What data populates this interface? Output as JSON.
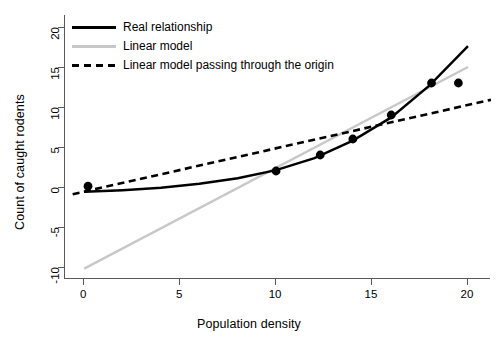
{
  "chart_data": {
    "type": "scatter",
    "title": "",
    "xlabel": "Population density",
    "ylabel": "Count of caught rodents",
    "xlim": [
      -1.0,
      21.2
    ],
    "ylim": [
      -11.5,
      21.5
    ],
    "xticks": [
      0,
      5,
      10,
      15,
      20
    ],
    "xtick_labels": [
      "0",
      "5",
      "10",
      "15",
      "20"
    ],
    "yticks": [
      -10,
      -5,
      0,
      5,
      10,
      15,
      20
    ],
    "ytick_labels": [
      "-10",
      "-5",
      "0",
      "5",
      "10",
      "15",
      "20"
    ],
    "grid": false,
    "legend_position": "top-left",
    "points": [
      {
        "x": 0.2,
        "y": 0.1
      },
      {
        "x": 10.0,
        "y": 2.0
      },
      {
        "x": 12.3,
        "y": 4.0
      },
      {
        "x": 14.0,
        "y": 6.0
      },
      {
        "x": 16.0,
        "y": 9.0
      },
      {
        "x": 18.1,
        "y": 13.0
      },
      {
        "x": 19.5,
        "y": 13.0
      }
    ],
    "series": [
      {
        "name": "Real relationship",
        "type": "curve",
        "color": "#000000",
        "style": "solid",
        "width": 2.4,
        "x": [
          0,
          2,
          4,
          6,
          8,
          10,
          12,
          14,
          16,
          18,
          20
        ],
        "y": [
          -0.6,
          -0.4,
          -0.1,
          0.4,
          1.1,
          2.1,
          3.6,
          5.8,
          8.7,
          12.7,
          17.6
        ]
      },
      {
        "name": "Linear model",
        "type": "line",
        "color": "#c8c8c8",
        "style": "solid",
        "width": 2.4,
        "intercept": -10.2,
        "slope": 1.26,
        "x": [
          0,
          20
        ],
        "y": [
          -10.2,
          15.0
        ]
      },
      {
        "name": "Linear model passing through the origin",
        "type": "line",
        "color": "#000000",
        "style": "dashed",
        "width": 2.6,
        "intercept": -0.6,
        "slope": 0.56,
        "x": [
          -0.6,
          21.2
        ],
        "y": [
          -0.9,
          10.9
        ]
      }
    ],
    "legend": [
      {
        "label": "Real relationship",
        "key": "solid-dark"
      },
      {
        "label": "Linear model",
        "key": "solid-gray"
      },
      {
        "label": "Linear model passing through the origin",
        "key": "dashed-dark"
      }
    ]
  }
}
